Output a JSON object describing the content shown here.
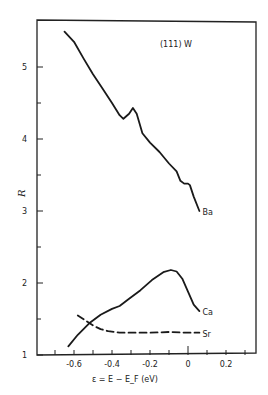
{
  "chart_data": {
    "type": "line",
    "title": "(111) W",
    "xlabel": "ε = E − E_F  (eV)",
    "ylabel": "R",
    "xlim": [
      -0.72,
      0.36
    ],
    "ylim": [
      1,
      5.65
    ],
    "grid": false,
    "legend_position": "inline labels at curve ends",
    "x_ticks": [
      -0.6,
      -0.4,
      -0.2,
      0,
      0.2
    ],
    "x_tick_labels": [
      "-0.6",
      "-0.4",
      "-0.2",
      "0",
      "0.2"
    ],
    "y_ticks": [
      1,
      2,
      3,
      4,
      5
    ],
    "y_tick_labels": [
      "1",
      "2",
      "3",
      "4",
      "5"
    ],
    "series": [
      {
        "name": "Ba",
        "style": "solid",
        "x": [
          -0.65,
          -0.6,
          -0.55,
          -0.5,
          -0.45,
          -0.4,
          -0.36,
          -0.34,
          -0.31,
          -0.29,
          -0.27,
          -0.24,
          -0.2,
          -0.15,
          -0.1,
          -0.06,
          -0.04,
          -0.02,
          0.0,
          0.01,
          0.03,
          0.06
        ],
        "y": [
          5.49,
          5.35,
          5.12,
          4.9,
          4.7,
          4.5,
          4.33,
          4.28,
          4.35,
          4.43,
          4.35,
          4.08,
          3.95,
          3.82,
          3.66,
          3.55,
          3.42,
          3.38,
          3.38,
          3.36,
          3.2,
          3.0
        ]
      },
      {
        "name": "Ca",
        "style": "solid",
        "x": [
          -0.63,
          -0.58,
          -0.52,
          -0.46,
          -0.4,
          -0.36,
          -0.31,
          -0.25,
          -0.19,
          -0.13,
          -0.09,
          -0.06,
          -0.03,
          0.0,
          0.03,
          0.06
        ],
        "y": [
          1.12,
          1.28,
          1.44,
          1.56,
          1.64,
          1.68,
          1.78,
          1.9,
          2.04,
          2.15,
          2.18,
          2.16,
          2.06,
          1.88,
          1.7,
          1.61
        ]
      },
      {
        "name": "Sr",
        "style": "dashed",
        "x": [
          -0.58,
          -0.54,
          -0.5,
          -0.46,
          -0.42,
          -0.36,
          -0.3,
          -0.2,
          -0.1,
          0.0,
          0.06
        ],
        "y": [
          1.55,
          1.48,
          1.41,
          1.36,
          1.33,
          1.31,
          1.31,
          1.31,
          1.32,
          1.31,
          1.31
        ]
      }
    ]
  }
}
